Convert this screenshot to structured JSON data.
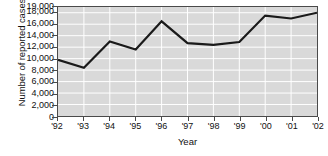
{
  "chart_data": {
    "type": "line",
    "title": "",
    "xlabel": "Year",
    "ylabel": "Number of reported cases",
    "categories": [
      "'92",
      "'93",
      "'94",
      "'95",
      "'96",
      "'97",
      "'98",
      "'99",
      "'00",
      "'01",
      "'02"
    ],
    "values": [
      9800,
      8400,
      13000,
      11600,
      16500,
      12700,
      12400,
      12900,
      17500,
      17000,
      18000
    ],
    "series": [
      {
        "name": "Number of reported cases",
        "values": [
          9800,
          8400,
          13000,
          11600,
          16500,
          12700,
          12400,
          12900,
          17500,
          17000,
          18000
        ]
      }
    ],
    "ylim": [
      0,
      19000
    ],
    "y_ticks": [
      0,
      2000,
      4000,
      6000,
      8000,
      10000,
      12000,
      14000,
      16000,
      18000,
      19000
    ],
    "y_tick_labels": [
      "0",
      "2,000",
      "4,000",
      "6,000",
      "8,000",
      "10,000",
      "12,000",
      "14,000",
      "16,000",
      "18,000",
      "19,000"
    ],
    "grid": true,
    "grid_color": "#ffffff",
    "plot_background": "#d9d9d9",
    "line_color": "#1a1a1a",
    "legend": false,
    "legend_position": "none",
    "annotations": []
  },
  "axes": {
    "y_title": "Number of reported cases",
    "x_title": "Year"
  }
}
